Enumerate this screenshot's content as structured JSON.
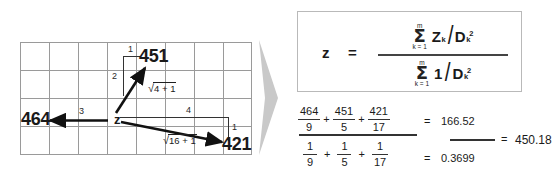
{
  "figure": {
    "title_diagram": "idw-interpolation-diagram",
    "grid": {
      "columns": 8,
      "rows": 4,
      "line_color": "#9a9a9a"
    },
    "center_point": {
      "label": "z",
      "description": "unknown-point"
    },
    "samples": [
      {
        "value": "451",
        "direction": "upper-right",
        "offset_x": "1",
        "offset_y": "2",
        "distance_expr_sign": "√",
        "distance_expr_body": "4 + 1",
        "distance": "5"
      },
      {
        "value": "464",
        "direction": "left",
        "offset_x": "3",
        "offset_y": "",
        "distance_expr_sign": "",
        "distance_expr_body": "",
        "distance": "9"
      },
      {
        "value": "421",
        "direction": "lower-right",
        "offset_x": "4",
        "offset_y": "1",
        "distance_expr_sign": "√",
        "distance_expr_body": "16 + 1",
        "distance": "17"
      }
    ]
  },
  "arrow_separator": {
    "name": "gray-right-arrow",
    "color": "#c9c9c9"
  },
  "formula": {
    "lhs": "z",
    "equals": "=",
    "numerator": {
      "sum_symbol": "Σ",
      "limit_top": "m",
      "limit_bottom": "k = 1",
      "term_numerator": "Z",
      "term_numerator_sub": "k",
      "slash": "/",
      "term_denominator": "D",
      "term_denominator_sub": "k",
      "term_denominator_sup": "2"
    },
    "denominator": {
      "sum_symbol": "Σ",
      "limit_top": "m",
      "limit_bottom": "k = 1",
      "term_numerator": "1",
      "slash": "/",
      "term_denominator": "D",
      "term_denominator_sub": "k",
      "term_denominator_sup": "2"
    }
  },
  "calculation": {
    "numerator_terms": [
      {
        "num": "464",
        "den": "9"
      },
      {
        "num": "451",
        "den": "5"
      },
      {
        "num": "421",
        "den": "17"
      }
    ],
    "denominator_terms": [
      {
        "num": "1",
        "den": "9"
      },
      {
        "num": "1",
        "den": "5"
      },
      {
        "num": "1",
        "den": "17"
      }
    ],
    "plus": "+",
    "equals": "=",
    "numerator_result": "166.52",
    "denominator_result": "0.3699",
    "final_result": "450.18"
  }
}
